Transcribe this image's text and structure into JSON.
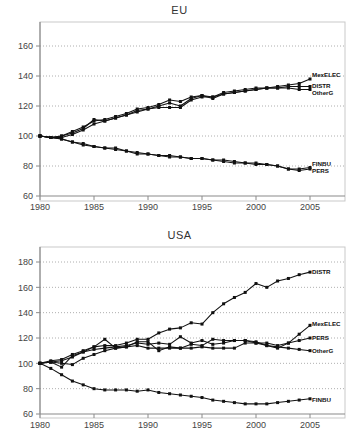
{
  "charts": [
    {
      "title": "EU",
      "ylim": [
        60,
        160
      ],
      "yticks": [
        60,
        80,
        100,
        120,
        140,
        160
      ],
      "xlim": [
        1980,
        2005
      ],
      "xticks": [
        1980,
        1985,
        1990,
        1995,
        2000,
        2005
      ],
      "label_order": [
        "MexELEC",
        "DISTR",
        "OtherG",
        "FINBU",
        "PERS"
      ],
      "label_y": {
        "MexELEC": 140.5,
        "DISTR": 133.5,
        "OtherG": 128.5,
        "FINBU": 81.5,
        "PERS": 76.5
      }
    },
    {
      "title": "USA",
      "ylim": [
        60,
        180
      ],
      "yticks": [
        60,
        80,
        100,
        120,
        140,
        160,
        180
      ],
      "xlim": [
        1980,
        2005
      ],
      "xticks": [
        1980,
        1985,
        1990,
        1995,
        2000,
        2005
      ],
      "label_order": [
        "DISTR",
        "MexELEC",
        "PERS",
        "OtherG",
        "FINBU"
      ],
      "label_y": {
        "DISTR": 172,
        "MexELEC": 131,
        "PERS": 120,
        "OtherG": 110,
        "FINBU": 71
      }
    }
  ],
  "chart_data": [
    {
      "type": "line",
      "title": "EU",
      "xlabel": "",
      "ylabel": "",
      "xlim": [
        1980,
        2005
      ],
      "ylim": [
        60,
        160
      ],
      "xticks": [
        1980,
        1985,
        1990,
        1995,
        2000,
        2005
      ],
      "yticks": [
        60,
        80,
        100,
        120,
        140,
        160
      ],
      "grid": "horizontal-dotted",
      "legend": "inline-right",
      "x": [
        1980,
        1981,
        1982,
        1983,
        1984,
        1985,
        1986,
        1987,
        1988,
        1989,
        1990,
        1991,
        1992,
        1993,
        1994,
        1995,
        1996,
        1997,
        1998,
        1999,
        2000,
        2001,
        2002,
        2003,
        2004,
        2005
      ],
      "series": [
        {
          "name": "MexELEC",
          "values": [
            100,
            99,
            100,
            103,
            106,
            110,
            111,
            113,
            115,
            118,
            119,
            121,
            124,
            123,
            126,
            127,
            126,
            129,
            130,
            131,
            132,
            132,
            133,
            134,
            135,
            138
          ]
        },
        {
          "name": "DISTR",
          "values": [
            100,
            99,
            100,
            102,
            105,
            111,
            110,
            112,
            114,
            117,
            118,
            120,
            122,
            120,
            125,
            127,
            125,
            128,
            129,
            130,
            131,
            132,
            132,
            133,
            133,
            133
          ]
        },
        {
          "name": "OtherG",
          "values": [
            100,
            99,
            99,
            101,
            104,
            108,
            110,
            112,
            114,
            116,
            118,
            119,
            119,
            119,
            124,
            126,
            126,
            128,
            129,
            130,
            131,
            132,
            132,
            132,
            131,
            131
          ]
        },
        {
          "name": "FINBU",
          "values": [
            100,
            99,
            98,
            96,
            95,
            93,
            92,
            92,
            90,
            89,
            88,
            87,
            87,
            86,
            85,
            85,
            84,
            84,
            83,
            82,
            82,
            81,
            80,
            78,
            78,
            79
          ]
        },
        {
          "name": "PERS",
          "values": [
            100,
            99,
            98,
            96,
            94,
            93,
            92,
            91,
            90,
            88,
            88,
            87,
            86,
            86,
            85,
            85,
            84,
            83,
            82,
            82,
            81,
            81,
            80,
            78,
            77,
            78
          ]
        }
      ]
    },
    {
      "type": "line",
      "title": "USA",
      "xlabel": "",
      "ylabel": "",
      "xlim": [
        1980,
        2005
      ],
      "ylim": [
        60,
        180
      ],
      "xticks": [
        1980,
        1985,
        1990,
        1995,
        2000,
        2005
      ],
      "yticks": [
        60,
        80,
        100,
        120,
        140,
        160,
        180
      ],
      "grid": "horizontal-dotted",
      "legend": "inline-right",
      "x": [
        1980,
        1981,
        1982,
        1983,
        1984,
        1985,
        1986,
        1987,
        1988,
        1989,
        1990,
        1991,
        1992,
        1993,
        1994,
        1995,
        1996,
        1997,
        1998,
        1999,
        2000,
        2001,
        2002,
        2003,
        2004,
        2005
      ],
      "series": [
        {
          "name": "DISTR",
          "values": [
            100,
            101,
            97,
            106,
            109,
            113,
            119,
            112,
            113,
            117,
            117,
            110,
            113,
            112,
            115,
            114,
            119,
            118,
            118,
            118,
            117,
            114,
            112,
            116,
            123,
            130
          ]
        },
        {
          "name": "MexELEC",
          "values": [
            100,
            102,
            103,
            107,
            110,
            113,
            114,
            114,
            116,
            119,
            119,
            124,
            127,
            128,
            132,
            131,
            140,
            147,
            152,
            156,
            163,
            160,
            165,
            167,
            170,
            172
          ]
        },
        {
          "name": "PERS",
          "values": [
            100,
            101,
            102,
            105,
            109,
            111,
            112,
            113,
            114,
            116,
            115,
            116,
            115,
            121,
            116,
            118,
            115,
            116,
            118,
            118,
            116,
            116,
            114,
            116,
            118,
            120
          ]
        },
        {
          "name": "OtherG",
          "values": [
            100,
            101,
            100,
            99,
            104,
            107,
            110,
            112,
            113,
            114,
            112,
            112,
            112,
            112,
            112,
            113,
            112,
            112,
            112,
            116,
            116,
            114,
            113,
            112,
            111,
            110
          ]
        },
        {
          "name": "FINBU",
          "values": [
            100,
            96,
            91,
            86,
            83,
            80,
            79,
            79,
            79,
            78,
            79,
            77,
            76,
            75,
            74,
            73,
            71,
            70,
            69,
            68,
            68,
            68,
            69,
            70,
            71,
            72
          ]
        }
      ]
    }
  ]
}
